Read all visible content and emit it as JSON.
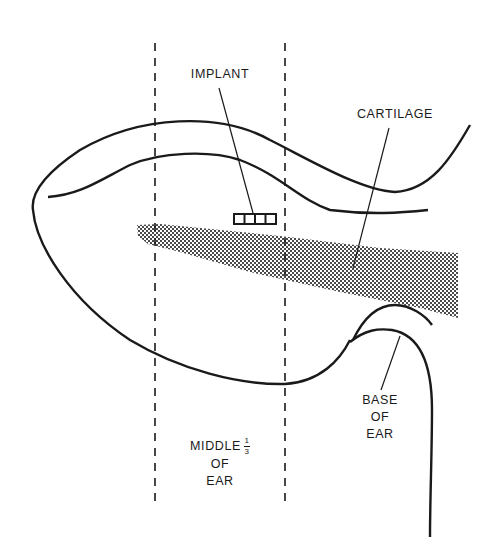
{
  "diagram": {
    "labels": {
      "implant": "IMPLANT",
      "cartilage": "CARTILAGE",
      "middle_line1": "MIDDLE",
      "middle_frac_num": "1",
      "middle_frac_den": "3",
      "middle_line2": "OF",
      "middle_line3": "EAR",
      "base_line1": "BASE",
      "base_line2": "OF",
      "base_line3": "EAR"
    },
    "colors": {
      "ink": "#1a1a1a",
      "background": "#ffffff"
    }
  }
}
